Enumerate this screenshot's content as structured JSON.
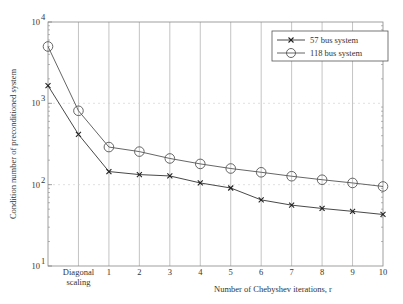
{
  "chart_data": {
    "type": "line",
    "title": "",
    "xlabel": "Number of Chebyshev iterations, r",
    "ylabel": "Condition number of preconditioned system",
    "yscale": "log",
    "ylim": [
      10,
      10000
    ],
    "y_ticks": [
      {
        "value": 10000,
        "base": "10",
        "exp": "4"
      },
      {
        "value": 1000,
        "base": "10",
        "exp": "3"
      },
      {
        "value": 100,
        "base": "10",
        "exp": "2"
      },
      {
        "value": 10,
        "base": "10",
        "exp": "1"
      }
    ],
    "categories": [
      "",
      "Diagonal scaling",
      "1",
      "2",
      "3",
      "4",
      "5",
      "6",
      "7",
      "8",
      "9",
      "10"
    ],
    "category_labels": [
      {
        "line1": "",
        "line2": ""
      },
      {
        "line1": "Diagonal",
        "line2": "scaling"
      },
      {
        "line1": "1",
        "line2": ""
      },
      {
        "line1": "2",
        "line2": ""
      },
      {
        "line1": "3",
        "line2": ""
      },
      {
        "line1": "4",
        "line2": ""
      },
      {
        "line1": "5",
        "line2": ""
      },
      {
        "line1": "6",
        "line2": ""
      },
      {
        "line1": "7",
        "line2": ""
      },
      {
        "line1": "8",
        "line2": ""
      },
      {
        "line1": "9",
        "line2": ""
      },
      {
        "line1": "10",
        "line2": ""
      }
    ],
    "series": [
      {
        "name": "57 bus system",
        "marker": "x",
        "color": "#333333",
        "values": [
          1650,
          415,
          145,
          133,
          128,
          105,
          91,
          65,
          56,
          51,
          47,
          43
        ]
      },
      {
        "name": "118 bus system",
        "marker": "o",
        "color": "#555555",
        "values": [
          5000,
          810,
          290,
          255,
          210,
          180,
          158,
          142,
          127,
          115,
          105,
          95
        ]
      }
    ],
    "grid": {
      "vertical": true,
      "horizontal_dashed": true
    },
    "legend_position": "upper right"
  },
  "legend": {
    "items": [
      {
        "label": "57 bus system"
      },
      {
        "label": "118 bus system"
      }
    ]
  }
}
